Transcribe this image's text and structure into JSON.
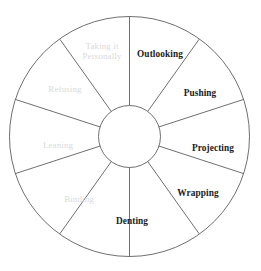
{
  "figure": {
    "name": "behaviour-wheel-diagram",
    "shape": "circular wheel divided into ten equal segments with a blank hub",
    "segments_count": 10,
    "colors": {
      "background": "#ffffff",
      "stroke": "#4a4a4a",
      "dark_label": "#1b1b1b",
      "light_label": "#dadada",
      "hub_fill": "#ffffff"
    },
    "geometry": {
      "center_x": 129.5,
      "center_y": 136.5,
      "outer_radius": 120,
      "hub_radius": 31,
      "segment_angle_deg": 36,
      "first_spoke_angle_deg": 0
    }
  },
  "segments": [
    {
      "id": "outlooking",
      "label": "Outlooking",
      "emphasis": "dark",
      "label_x": 160,
      "label_y": 54,
      "lines": [
        "Outlooking"
      ]
    },
    {
      "id": "pushing",
      "label": "Pushing",
      "emphasis": "dark",
      "label_x": 200,
      "label_y": 93,
      "lines": [
        "Pushing"
      ]
    },
    {
      "id": "projecting",
      "label": "Projecting",
      "emphasis": "dark",
      "label_x": 213,
      "label_y": 148,
      "lines": [
        "Projecting"
      ]
    },
    {
      "id": "wrapping",
      "label": "Wrapping",
      "emphasis": "dark",
      "label_x": 198,
      "label_y": 193,
      "lines": [
        "Wrapping"
      ]
    },
    {
      "id": "denting",
      "label": "Denting",
      "emphasis": "dark",
      "label_x": 132,
      "label_y": 221,
      "lines": [
        "Denting"
      ]
    },
    {
      "id": "binding",
      "label": "Binding",
      "emphasis": "light",
      "label_x": 79,
      "label_y": 199,
      "lines": [
        "Binding"
      ]
    },
    {
      "id": "leaning",
      "label": "Leaning",
      "emphasis": "light",
      "label_x": 58,
      "label_y": 145,
      "lines": [
        "Leaning"
      ]
    },
    {
      "id": "refusing",
      "label": "Refusing",
      "emphasis": "light",
      "label_x": 65,
      "label_y": 89,
      "lines": [
        "Refusing"
      ]
    },
    {
      "id": "taking-it-personally",
      "label": "Taking it Personally",
      "emphasis": "light",
      "label_x": 102,
      "label_y": 51,
      "lines": [
        "Taking it",
        "Personally"
      ]
    }
  ]
}
